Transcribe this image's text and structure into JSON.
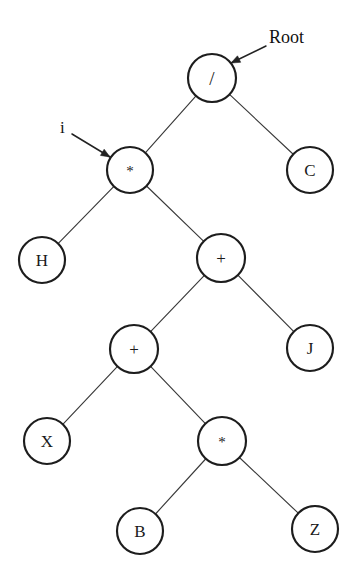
{
  "diagram": {
    "background_color": "#ffffff",
    "node_stroke_color": "#1d1d1d",
    "edge_stroke_color": "#3a3a3a",
    "label_color": "#1a1a1a",
    "node_radius": 23,
    "nodes": [
      {
        "id": "n_div",
        "label": "/",
        "x": 212,
        "y": 78,
        "r": 24,
        "kind": "operator"
      },
      {
        "id": "n_mul1",
        "label": "*",
        "x": 130,
        "y": 170,
        "r": 23,
        "kind": "operator"
      },
      {
        "id": "n_c",
        "label": "C",
        "x": 310,
        "y": 170,
        "r": 23,
        "kind": "operand"
      },
      {
        "id": "n_h",
        "label": "H",
        "x": 42,
        "y": 260,
        "r": 23,
        "kind": "operand"
      },
      {
        "id": "n_plus1",
        "label": "+",
        "x": 221,
        "y": 258,
        "r": 24,
        "kind": "operator"
      },
      {
        "id": "n_plus2",
        "label": "+",
        "x": 134,
        "y": 349,
        "r": 24,
        "kind": "operator"
      },
      {
        "id": "n_j",
        "label": "J",
        "x": 310,
        "y": 348,
        "r": 23,
        "kind": "operand"
      },
      {
        "id": "n_x",
        "label": "X",
        "x": 47,
        "y": 441,
        "r": 23,
        "kind": "operand"
      },
      {
        "id": "n_mul2",
        "label": "*",
        "x": 222,
        "y": 441,
        "r": 24,
        "kind": "operator"
      },
      {
        "id": "n_b",
        "label": "B",
        "x": 140,
        "y": 531,
        "r": 23,
        "kind": "operand"
      },
      {
        "id": "n_z",
        "label": "Z",
        "x": 315,
        "y": 529,
        "r": 23,
        "kind": "operand"
      }
    ],
    "edges": [
      {
        "id": "e1",
        "from": "n_div",
        "to": "n_mul1",
        "side": "left"
      },
      {
        "id": "e2",
        "from": "n_div",
        "to": "n_c",
        "side": "right"
      },
      {
        "id": "e3",
        "from": "n_mul1",
        "to": "n_h",
        "side": "left"
      },
      {
        "id": "e4",
        "from": "n_mul1",
        "to": "n_plus1",
        "side": "right"
      },
      {
        "id": "e5",
        "from": "n_plus1",
        "to": "n_plus2",
        "side": "left"
      },
      {
        "id": "e6",
        "from": "n_plus1",
        "to": "n_j",
        "side": "right"
      },
      {
        "id": "e7",
        "from": "n_plus2",
        "to": "n_x",
        "side": "left"
      },
      {
        "id": "e8",
        "from": "n_plus2",
        "to": "n_mul2",
        "side": "right"
      },
      {
        "id": "e9",
        "from": "n_mul2",
        "to": "n_b",
        "side": "left"
      },
      {
        "id": "e10",
        "from": "n_mul2",
        "to": "n_z",
        "side": "right"
      }
    ],
    "annotations": [
      {
        "id": "a_root",
        "text": "Root",
        "text_x": 269,
        "text_y": 39,
        "arrow_from_x": 266,
        "arrow_from_y": 46,
        "arrow_to_x": 231,
        "arrow_to_y": 63,
        "target": "n_div"
      },
      {
        "id": "a_i",
        "text": "i",
        "text_x": 60,
        "text_y": 129,
        "arrow_from_x": 72,
        "arrow_from_y": 134,
        "arrow_to_x": 110,
        "arrow_to_y": 157,
        "target": "n_mul1"
      }
    ]
  }
}
